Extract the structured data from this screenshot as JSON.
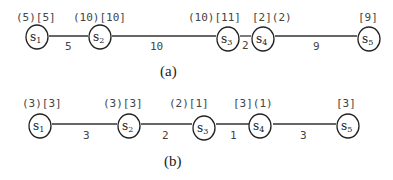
{
  "diagrams": [
    {
      "caption": "(a)",
      "nodes": [
        {
          "name": "s",
          "sub": "1",
          "label": "(5)[5]"
        },
        {
          "name": "s",
          "sub": "2",
          "label": "(10)[10]"
        },
        {
          "name": "s",
          "sub": "3",
          "label": "(10)[11]"
        },
        {
          "name": "s",
          "sub": "4",
          "label": "[2](2)"
        },
        {
          "name": "s",
          "sub": "5",
          "label": "[9]"
        }
      ],
      "edges": [
        {
          "from": "s1",
          "to": "s2",
          "weight": "5"
        },
        {
          "from": "s2",
          "to": "s3",
          "weight": "10"
        },
        {
          "from": "s3",
          "to": "s4",
          "weight": "2"
        },
        {
          "from": "s4",
          "to": "s5",
          "weight": "9"
        }
      ]
    },
    {
      "caption": "(b)",
      "nodes": [
        {
          "name": "s",
          "sub": "1",
          "label": "(3)[3]"
        },
        {
          "name": "s",
          "sub": "2",
          "label": "(3)[3]"
        },
        {
          "name": "s",
          "sub": "3",
          "label": "(2)[1]"
        },
        {
          "name": "s",
          "sub": "4",
          "label": "[3](1)"
        },
        {
          "name": "s",
          "sub": "5",
          "label": "[3]"
        }
      ],
      "edges": [
        {
          "from": "s1",
          "to": "s2",
          "weight": "3"
        },
        {
          "from": "s2",
          "to": "s3",
          "weight": "2"
        },
        {
          "from": "s3",
          "to": "s4",
          "weight": "1"
        },
        {
          "from": "s4",
          "to": "s5",
          "weight": "3"
        }
      ]
    }
  ]
}
